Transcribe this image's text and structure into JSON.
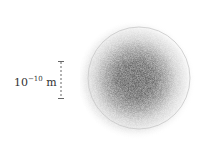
{
  "figure": {
    "scale_bar": {
      "base": "10",
      "exponent": "−10",
      "unit": "m",
      "label_full": "10^-10 m"
    },
    "cloud": {
      "center_color": "#5a5a5a",
      "edge_color": "#d8d8d8",
      "boundary_circle_color": "#c8c8c8"
    }
  }
}
